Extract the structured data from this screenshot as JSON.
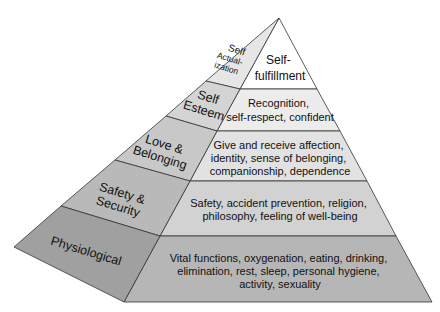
{
  "diagram": {
    "type": "pyramid",
    "colors": {
      "front": [
        "#ffffff",
        "#ececec",
        "#e2e2e2",
        "#d2d2d2",
        "#b6b6b6"
      ],
      "side": [
        "#e6e6e6",
        "#d4d4d4",
        "#c8c8c8",
        "#b9b9b9",
        "#a0a0a0"
      ],
      "stroke": "#333333"
    },
    "levels": [
      {
        "name_lines": [
          "Self",
          "Actual-",
          "ization"
        ],
        "description_lines": [
          "Self-",
          "fulfillment"
        ]
      },
      {
        "name_lines": [
          "Self",
          "Esteem"
        ],
        "description_lines": [
          "Recognition,",
          "self-respect, confident"
        ]
      },
      {
        "name_lines": [
          "Love &",
          "Belonging"
        ],
        "description_lines": [
          "Give and receive affection,",
          "identity, sense of belonging,",
          "companionship, dependence"
        ]
      },
      {
        "name_lines": [
          "Safety &",
          "Security"
        ],
        "description_lines": [
          "Safety, accident prevention, religion,",
          "philosophy, feeling of well-being"
        ]
      },
      {
        "name_lines": [
          "Physiological"
        ],
        "description_lines": [
          "Vital functions, oxygenation, eating, drinking,",
          "elimination, rest, sleep, personal hygiene,",
          "activity, sexuality"
        ]
      }
    ]
  }
}
